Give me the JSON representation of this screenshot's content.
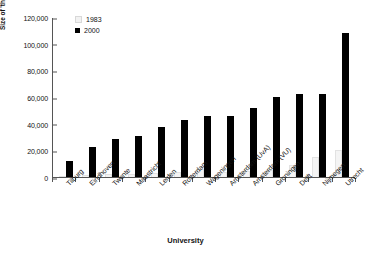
{
  "chart_data": {
    "type": "bar",
    "title": "",
    "xlabel": "University",
    "ylabel": "Size of 'third money stream' (€M)",
    "ylim": [
      0,
      120000
    ],
    "ytick_values": [
      0,
      20000,
      40000,
      60000,
      80000,
      100000,
      120000
    ],
    "ytick_labels": [
      "0",
      "20,000",
      "40,000",
      "60,000",
      "80,000",
      "100,000",
      "120,000"
    ],
    "grid": false,
    "legend_position": "top-left-inside",
    "categories": [
      "Tilburg",
      "Eindhoven",
      "Twente",
      "Maastricht",
      "Leiden",
      "Rotterdam",
      "Wageningen",
      "Amsterdam (UvA)",
      "Amsterdam (VU)",
      "Groningen",
      "Delft",
      "Nijmegen",
      "Utrecht"
    ],
    "series": [
      {
        "name": "1983",
        "color": "#f4f4f4",
        "values": [
          1000,
          1500,
          2000,
          2500,
          3000,
          3500,
          6000,
          4000,
          4500,
          5000,
          9000,
          15000,
          20000
        ]
      },
      {
        "name": "2000",
        "color": "#000000",
        "values": [
          12000,
          22500,
          28500,
          31000,
          37500,
          43000,
          45500,
          46000,
          52000,
          60000,
          62000,
          62500,
          108000
        ]
      }
    ]
  },
  "legend": {
    "entries": [
      {
        "label": "1983",
        "swatch": "light-square-icon"
      },
      {
        "label": "2000",
        "swatch": "black-square-icon"
      }
    ]
  }
}
